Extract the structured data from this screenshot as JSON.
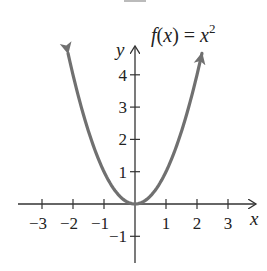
{
  "chart_data": {
    "type": "line",
    "function": "x^2",
    "xlabel": "x",
    "ylabel": "y",
    "x_ticks": [
      -3,
      -2,
      -1,
      1,
      2,
      3
    ],
    "y_ticks": [
      -1,
      1,
      2,
      3,
      4
    ],
    "xlim": [
      -3.9,
      3.8
    ],
    "ylim": [
      -1.8,
      4.9
    ],
    "grid": false,
    "legend": "none",
    "curve_x_range": [
      -2.16,
      2.16
    ],
    "curve_arrows": "both ends",
    "series": [
      {
        "name": "f(x) = x^2",
        "x": [
          -2.16,
          -2,
          -1.5,
          -1,
          -0.5,
          0,
          0.5,
          1,
          1.5,
          2,
          2.16
        ],
        "y": [
          4.67,
          4,
          2.25,
          1,
          0.25,
          0,
          0.25,
          1,
          2.25,
          4,
          4.67
        ],
        "color": "#707070"
      }
    ],
    "colors": {
      "axis": "#333333",
      "curve": "#707070",
      "text": "#222222",
      "background": "#ffffff"
    }
  },
  "labels": {
    "title_f": "f",
    "title_open": "(",
    "title_x": "x",
    "title_mid": ") = ",
    "title_x2": "x",
    "title_exp": "2",
    "x_axis": "x",
    "y_axis": "y",
    "x_tick_labels": [
      "−3",
      "−2",
      "−1",
      "1",
      "2",
      "3"
    ],
    "y_tick_labels": [
      "4",
      "3",
      "2",
      "1",
      "−1"
    ]
  }
}
